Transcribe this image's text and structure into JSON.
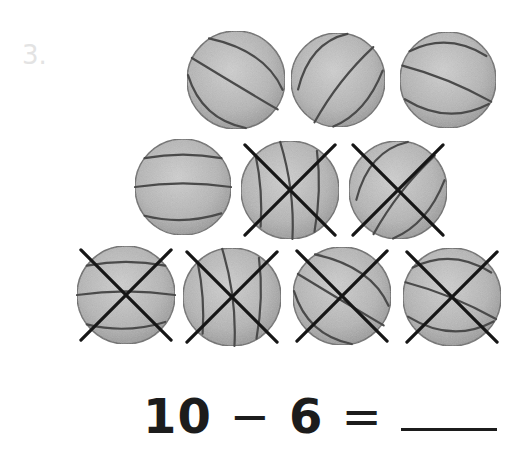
{
  "problem": {
    "number": "3.",
    "equation": {
      "minuend": "10",
      "operator": "−",
      "subtrahend": "6",
      "equals": "=",
      "answer": ""
    }
  },
  "balls": [
    {
      "id": 1,
      "cx": 236,
      "cy": 80,
      "r": 49,
      "crossed": false
    },
    {
      "id": 2,
      "cx": 338,
      "cy": 80,
      "r": 47,
      "crossed": false
    },
    {
      "id": 3,
      "cx": 448,
      "cy": 80,
      "r": 48,
      "crossed": false
    },
    {
      "id": 4,
      "cx": 183,
      "cy": 187,
      "r": 48,
      "crossed": false
    },
    {
      "id": 5,
      "cx": 290,
      "cy": 190,
      "r": 49,
      "crossed": true
    },
    {
      "id": 6,
      "cx": 398,
      "cy": 190,
      "r": 49,
      "crossed": true
    },
    {
      "id": 7,
      "cx": 126,
      "cy": 295,
      "r": 49,
      "crossed": true
    },
    {
      "id": 8,
      "cx": 232,
      "cy": 297,
      "r": 49,
      "crossed": true
    },
    {
      "id": 9,
      "cx": 342,
      "cy": 296,
      "r": 49,
      "crossed": true
    },
    {
      "id": 10,
      "cx": 452,
      "cy": 297,
      "r": 49,
      "crossed": true
    }
  ],
  "colors": {
    "ball_fill": "#b8b8b8",
    "ball_seam": "#4a4a4a",
    "cross": "#161616",
    "label": "#e3e3e3"
  }
}
